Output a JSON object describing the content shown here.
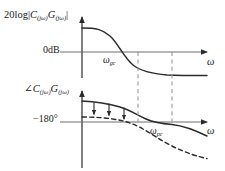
{
  "figure": {
    "kind": "bode-plot-diagram",
    "width": 225,
    "height": 171,
    "background": "#ffffff",
    "stroke_color": "#2b2b2b",
    "axis_color": "#6e6e6e",
    "dashed_guide_color": "#9a9a9a"
  },
  "magnitude_plot": {
    "axis_label": {
      "prefix": "20log|",
      "c_symbol": "C",
      "c_subscript": "(jω)",
      "g_symbol": "G",
      "g_subscript": "(jω)",
      "suffix": "|",
      "full_text": "20log|C(jω)G(jω)|"
    },
    "zero_level_label": "0dB",
    "omega_axis_label": "ω",
    "gain_crossover": {
      "symbol": "ω",
      "subscript": "gc",
      "full_text": "ωgc"
    }
  },
  "phase_plot": {
    "axis_label": {
      "angle_symbol": "∠",
      "c_symbol": "C",
      "c_subscript": "(jω)",
      "g_symbol": "G",
      "g_subscript": "(jω)",
      "full_text": "∠C(jω)G(jω)"
    },
    "reference_level_label": "−180°",
    "omega_axis_label": "ω",
    "phase_crossover": {
      "symbol": "ω",
      "subscript": "pc",
      "full_text": "ωpc"
    },
    "arrow_count": 3,
    "arrow_meaning": "phase-lag-reduction-arrows"
  },
  "curves": {
    "solid_name": "compensated-response",
    "dashed_name": "uncompensated-response"
  },
  "guides": {
    "first_guide_name": "gain-crossover-guide",
    "second_guide_name": "phase-crossover-guide"
  }
}
